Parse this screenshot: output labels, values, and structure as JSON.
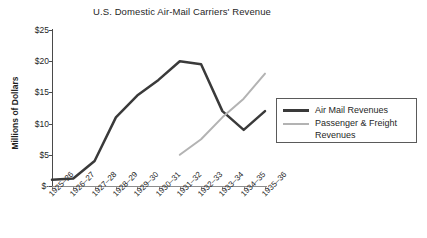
{
  "chart_data": {
    "type": "line",
    "title": "U.S. Domestic Air-Mail Carriers' Revenue",
    "xlabel": "",
    "ylabel": "Millions of Dollars",
    "ylim": [
      0,
      25
    ],
    "grid": false,
    "legend_position": "right",
    "y_ticks": [
      {
        "value": 25,
        "label": "$25"
      },
      {
        "value": 20,
        "label": "$20"
      },
      {
        "value": 15,
        "label": "$15"
      },
      {
        "value": 10,
        "label": "$10"
      },
      {
        "value": 5,
        "label": "$5"
      },
      {
        "value": 0,
        "label": "$-"
      }
    ],
    "categories": [
      "1925–26",
      "1926–27",
      "1927–28",
      "1928–29",
      "1929–30",
      "1930–31",
      "1931–32",
      "1932–33",
      "1933–34",
      "1934–35",
      "1935–36"
    ],
    "series": [
      {
        "name": "Air Mail Revenues",
        "color": "#3a3a3a",
        "width": 2.5,
        "values": [
          1.0,
          1.2,
          4.0,
          11.0,
          14.5,
          17.0,
          20.0,
          19.5,
          12.0,
          9.0,
          12.0
        ]
      },
      {
        "name": "Passenger & Freight Revenues",
        "color": "#b3b3b3",
        "width": 2.0,
        "values": [
          null,
          null,
          null,
          null,
          null,
          null,
          5.0,
          7.5,
          11.0,
          14.0,
          18.0
        ]
      }
    ]
  },
  "legend": {
    "entries": [
      {
        "label": "Air Mail Revenues",
        "color": "#3a3a3a"
      },
      {
        "label": "Passenger & Freight Revenues",
        "color": "#b3b3b3"
      }
    ]
  },
  "colors": {
    "air_mail": "#3a3a3a",
    "passenger_freight": "#b3b3b3",
    "axis": "#4a4a4a",
    "text": "#1f1f1f",
    "background": "#ffffff"
  }
}
